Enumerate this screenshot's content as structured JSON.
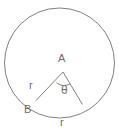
{
  "figure": {
    "kind": "circle-sector-diagram",
    "background_color": "#ffffff",
    "stroke_color": "#808080",
    "text_color": "#6e6e6e"
  },
  "labels": {
    "center_point": "A",
    "arc_point": "B",
    "radius_left": "r",
    "radius_arc": "r",
    "angle": "θ"
  },
  "geometry": {
    "circle": {
      "center_x": 59.5,
      "center_y": 63,
      "radius": 55
    },
    "vertex_a": {
      "x": 63,
      "y": 72
    },
    "vertex_b": {
      "x": 36,
      "y": 100.5
    },
    "vertex_c": {
      "x": 82.5,
      "y": 104.5
    },
    "angle_marker_radius": 12
  }
}
